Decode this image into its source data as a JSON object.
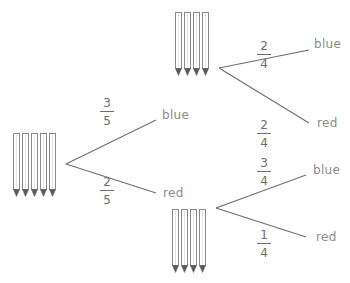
{
  "diagram": {
    "type": "probability-tree",
    "root": {
      "pencils": {
        "count": 5,
        "icon": "pencil-icon"
      },
      "branches": [
        {
          "label": "blue",
          "probability": {
            "numerator": "3",
            "denominator": "5"
          },
          "next": {
            "pencils": {
              "count": 4,
              "icon": "pencil-icon"
            },
            "branches": [
              {
                "label": "blue",
                "probability": {
                  "numerator": "2",
                  "denominator": "4"
                }
              },
              {
                "label": "red",
                "probability": {
                  "numerator": "2",
                  "denominator": "4"
                }
              }
            ]
          }
        },
        {
          "label": "red",
          "probability": {
            "numerator": "2",
            "denominator": "5"
          },
          "next": {
            "pencils": {
              "count": 4,
              "icon": "pencil-icon"
            },
            "branches": [
              {
                "label": "blue",
                "probability": {
                  "numerator": "3",
                  "denominator": "4"
                }
              },
              {
                "label": "red",
                "probability": {
                  "numerator": "1",
                  "denominator": "4"
                }
              }
            ]
          }
        }
      ]
    },
    "colors": {
      "line": "#6e6e6e",
      "text": "#8c8c8c",
      "pencil_outline": "#888888",
      "pencil_tip": "#555555"
    }
  }
}
